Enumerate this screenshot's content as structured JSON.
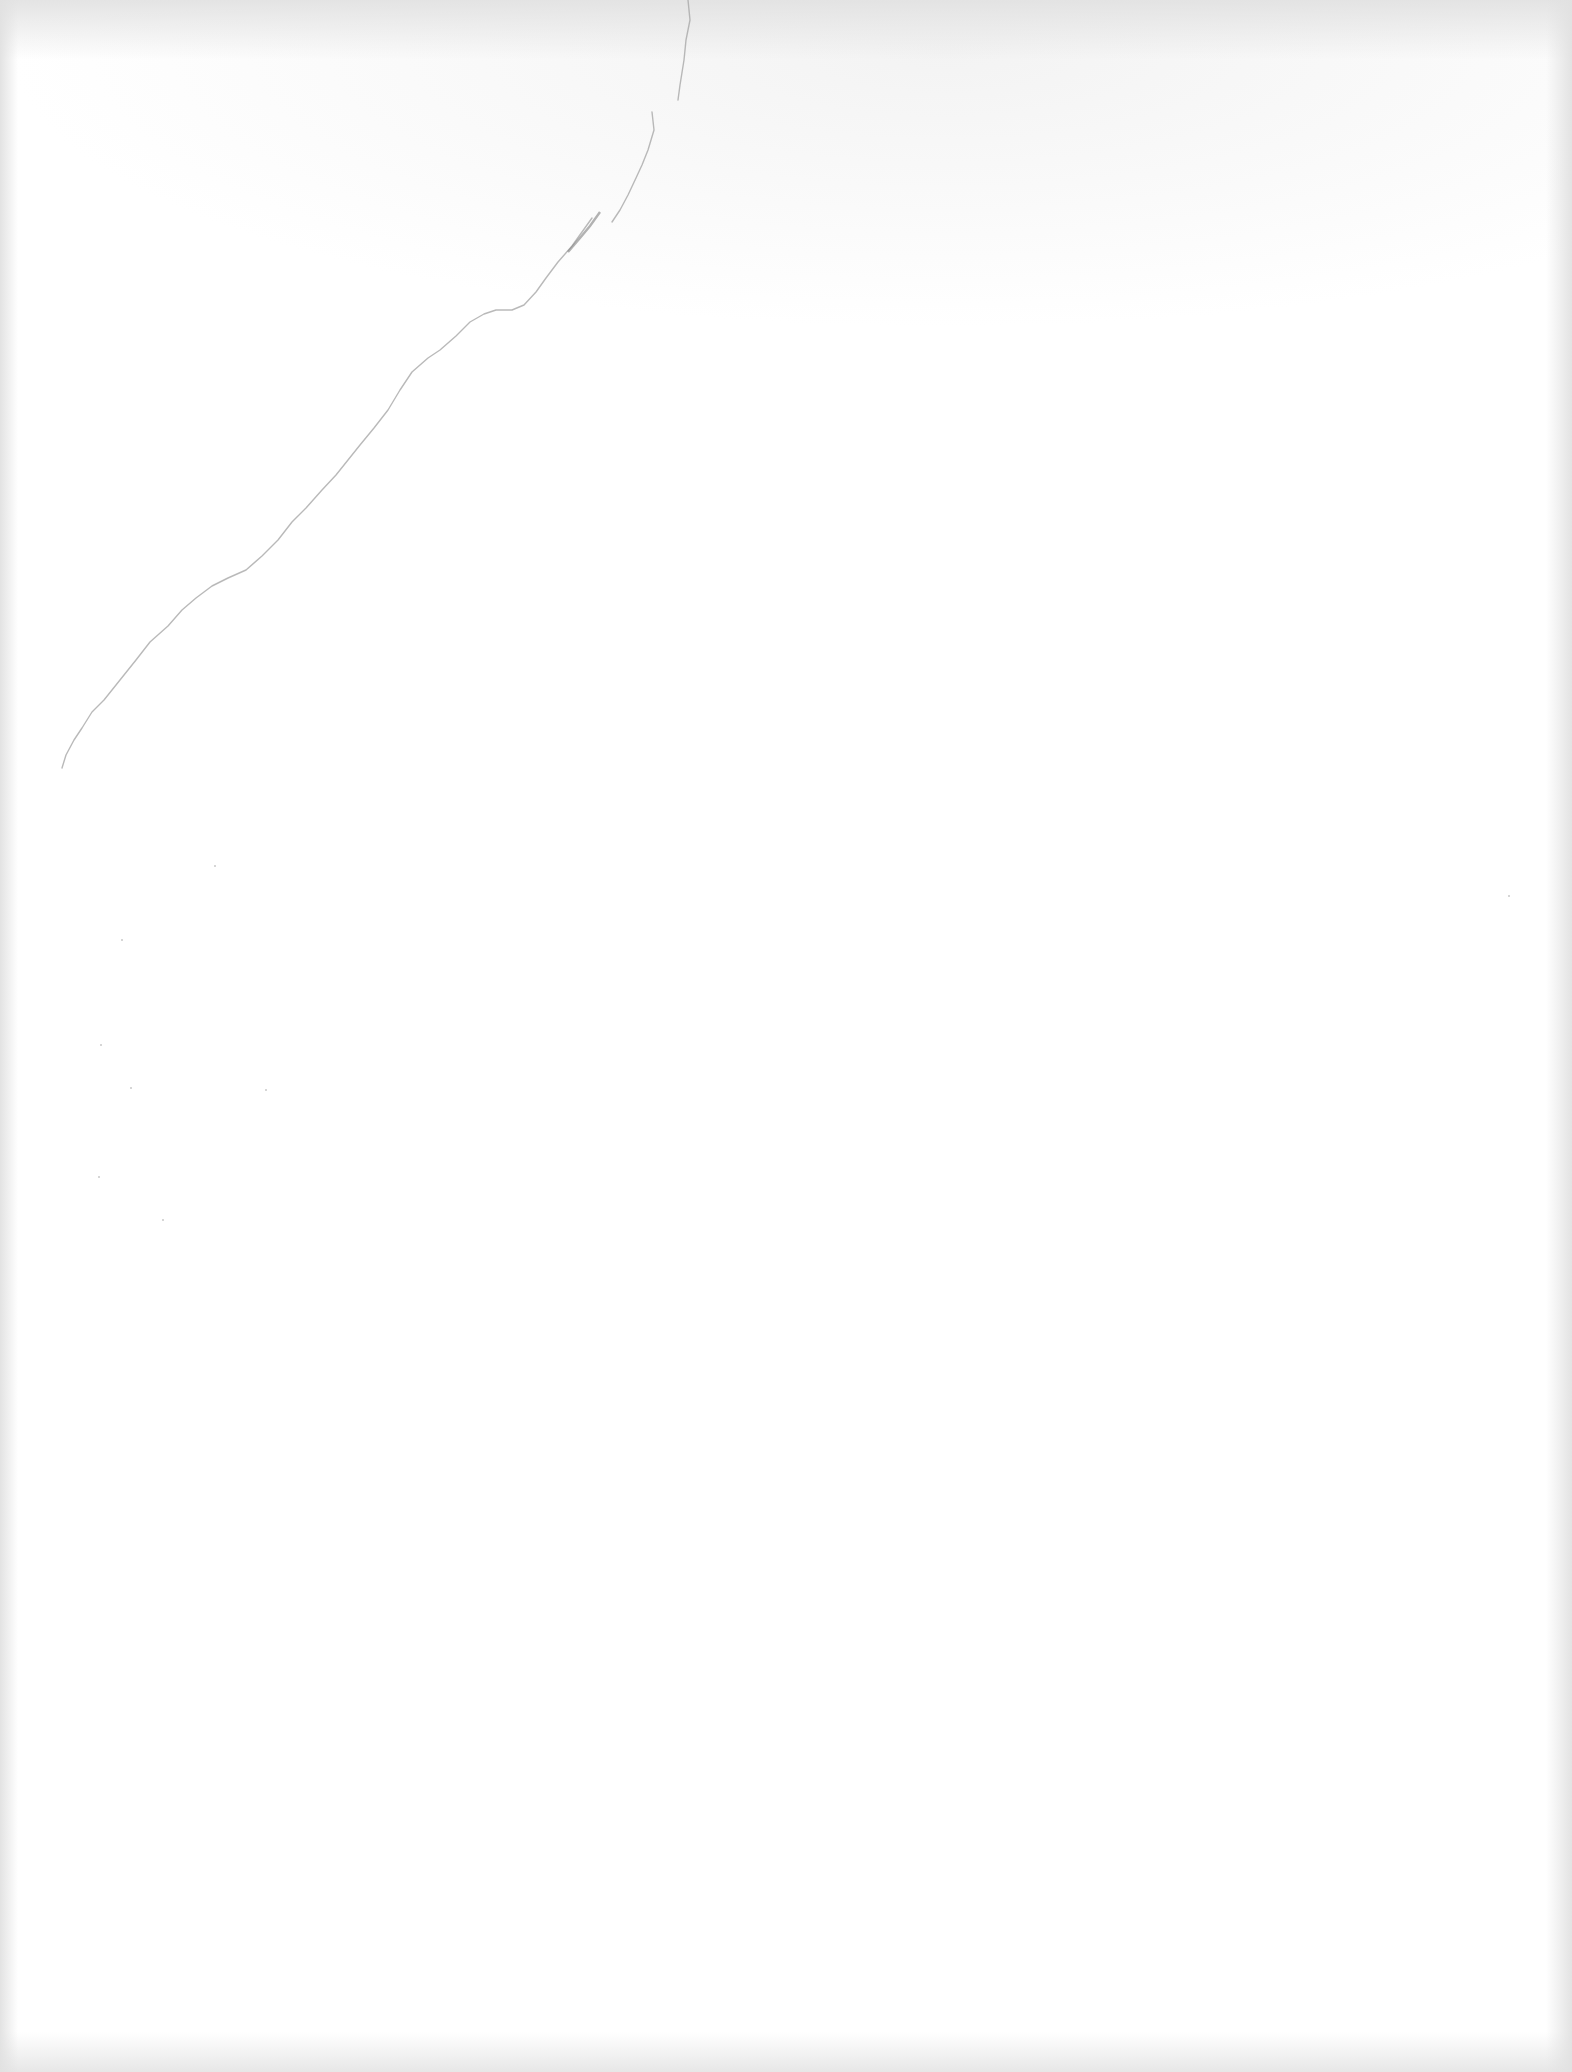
{
  "document": {
    "type": "blank scanned page",
    "text_content": "",
    "colors": {
      "paper": "#ffffff",
      "edge_shade": "#e1e1e1",
      "crease": "#9a9a9a"
    }
  }
}
